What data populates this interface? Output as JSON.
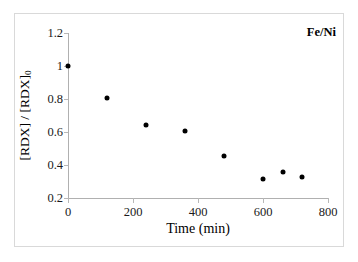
{
  "chart_data": {
    "type": "scatter",
    "title": "",
    "series_label": "Fe/Ni",
    "xlabel": "Time (min)",
    "ylabel": "[RDX] / [RDX]0",
    "ylabel_base": "[RDX] / [RDX]",
    "ylabel_sub": "0",
    "xlim": [
      0,
      800
    ],
    "ylim": [
      0.2,
      1.2
    ],
    "xticks": [
      0,
      200,
      400,
      600,
      800
    ],
    "xtick_labels": [
      "0",
      "200",
      "400",
      "600",
      "800"
    ],
    "yticks": [
      0.2,
      0.4,
      0.6,
      0.8,
      1.0,
      1.2
    ],
    "ytick_labels": [
      "0.2",
      "0.4",
      "0.6",
      "0.8",
      "1",
      "1.2"
    ],
    "grid": false,
    "legend": "none",
    "marker": "filled-diamond-black",
    "marker_color": "#000000",
    "x": [
      0,
      120,
      240,
      360,
      480,
      600,
      660,
      720
    ],
    "values": [
      1.0,
      0.805,
      0.645,
      0.605,
      0.455,
      0.315,
      0.36,
      0.33
    ],
    "points": [
      {
        "x": 0,
        "y": 1.0
      },
      {
        "x": 120,
        "y": 0.805
      },
      {
        "x": 240,
        "y": 0.645
      },
      {
        "x": 360,
        "y": 0.605
      },
      {
        "x": 480,
        "y": 0.455
      },
      {
        "x": 600,
        "y": 0.315
      },
      {
        "x": 660,
        "y": 0.36
      },
      {
        "x": 720,
        "y": 0.33
      }
    ]
  },
  "colors": {
    "axis": "#b0b0b0",
    "frame": "#d9d9d9",
    "text": "#1a1a1a",
    "marker": "#000000"
  }
}
